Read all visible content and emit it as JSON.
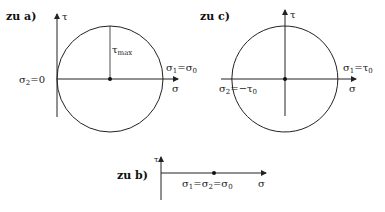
{
  "diagrams": {
    "a": {
      "title": "zu a)",
      "tau_axis": "τ",
      "sigma_axis": "σ",
      "radius_label": "τ",
      "radius_label_sub": "max",
      "right_label": "σ",
      "right_label_sub": "1",
      "right_label_rest": "=σ",
      "right_label_rest_sub": "0",
      "left_label": "σ",
      "left_label_sub": "2",
      "left_label_rest": "=0"
    },
    "b": {
      "title": "zu b)",
      "tau_axis": "τ",
      "sigma_axis": "σ",
      "point_label_a": "σ",
      "point_label_a_sub": "1",
      "point_label_b": "=σ",
      "point_label_b_sub": "2",
      "point_label_c": "=σ",
      "point_label_c_sub": "0"
    },
    "c": {
      "title": "zu c)",
      "tau_axis": "τ",
      "sigma_axis": "σ",
      "right_label": "σ",
      "right_label_sub": "1",
      "right_label_rest": "=τ",
      "right_label_rest_sub": "0",
      "left_label": "σ",
      "left_label_sub": "2",
      "left_label_rest": "=−τ",
      "left_label_rest_sub": "0"
    }
  },
  "colors": {
    "stroke": "#222222"
  }
}
